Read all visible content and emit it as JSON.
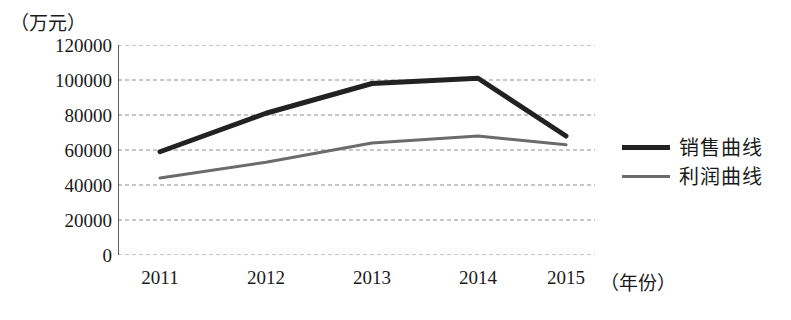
{
  "chart_data": {
    "type": "line",
    "title": "",
    "xlabel": "（年份）",
    "ylabel": "（万元）",
    "categories": [
      "2011",
      "2012",
      "2013",
      "2014",
      "2015"
    ],
    "ylim": [
      0,
      120000
    ],
    "yticks": [
      "0",
      "20000",
      "40000",
      "60000",
      "80000",
      "100000",
      "120000"
    ],
    "ytick_values": [
      0,
      20000,
      40000,
      60000,
      80000,
      100000,
      120000
    ],
    "grid": true,
    "grid_style": "dashed horizontal",
    "legend_position": "right",
    "series": [
      {
        "name": "销售曲线",
        "values": [
          59000,
          81000,
          98000,
          101000,
          68000
        ],
        "color": "#222222",
        "line_width": 5
      },
      {
        "name": "利润曲线",
        "values": [
          44000,
          53000,
          64000,
          68000,
          63000
        ],
        "color": "#6b6b6b",
        "line_width": 3
      }
    ]
  },
  "axes": {
    "y_unit_caption": "（万元）",
    "x_unit_caption": "（年份）",
    "y_tick_0": "0",
    "y_tick_1": "20000",
    "y_tick_2": "40000",
    "y_tick_3": "60000",
    "y_tick_4": "80000",
    "y_tick_5": "100000",
    "y_tick_6": "120000",
    "x_tick_0": "2011",
    "x_tick_1": "2012",
    "x_tick_2": "2013",
    "x_tick_3": "2014",
    "x_tick_4": "2015"
  },
  "legend": {
    "sales_label": "销售曲线",
    "profit_label": "利润曲线"
  }
}
